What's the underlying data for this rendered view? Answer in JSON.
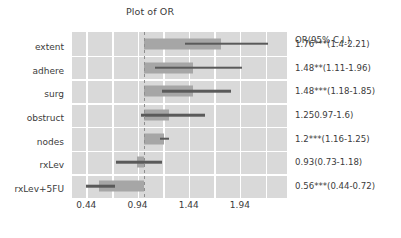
{
  "chart_data": {
    "type": "bar",
    "subtype": "forest-plot",
    "title": "Plot of OR",
    "xlabel": "",
    "ylabel": "",
    "xticks": [
      0.44,
      0.94,
      1.44,
      1.94
    ],
    "xtick_labels": [
      "0.44",
      "0.94",
      "1.44",
      "1.94"
    ],
    "xlim": [
      0.3,
      2.4
    ],
    "reference_line": 1.0,
    "grid": true,
    "grid_color": "#ffffff",
    "panel_color": "#d9d9d9",
    "bar_color": "#a6a6a6",
    "whisker_color": "#5a5a5a",
    "annotation_header": "OR(95% C.I.)",
    "categories": [
      "extent",
      "adhere",
      "surg",
      "obstruct",
      "nodes",
      "rxLev",
      "rxLev+5FU"
    ],
    "values": [
      1.76,
      1.48,
      1.48,
      1.25,
      1.2,
      0.93,
      0.56
    ],
    "ci_low": [
      1.4,
      1.11,
      1.18,
      0.97,
      1.16,
      0.73,
      0.44
    ],
    "ci_high": [
      2.21,
      1.96,
      1.85,
      1.6,
      1.25,
      1.18,
      0.72
    ],
    "significance": [
      "***",
      "**",
      "***",
      "",
      "***",
      "",
      "***"
    ],
    "rows": [
      {
        "label": "extent",
        "or": 1.76,
        "low": 1.4,
        "high": 2.21,
        "stars": "***",
        "annotation": "1.76***(1.4-2.21)"
      },
      {
        "label": "adhere",
        "or": 1.48,
        "low": 1.11,
        "high": 1.96,
        "stars": "**",
        "annotation": "1.48**(1.11-1.96)"
      },
      {
        "label": "surg",
        "or": 1.48,
        "low": 1.18,
        "high": 1.85,
        "stars": "***",
        "annotation": "1.48***(1.18-1.85)"
      },
      {
        "label": "obstruct",
        "or": 1.25,
        "low": 0.97,
        "high": 1.6,
        "stars": "",
        "annotation": "1.250.97-1.6)"
      },
      {
        "label": "nodes",
        "or": 1.2,
        "low": 1.16,
        "high": 1.25,
        "stars": "***",
        "annotation": "1.2***(1.16-1.25)"
      },
      {
        "label": "rxLev",
        "or": 0.93,
        "low": 0.73,
        "high": 1.18,
        "stars": "",
        "annotation": "0.93(0.73-1.18)"
      },
      {
        "label": "rxLev+5FU",
        "or": 0.56,
        "low": 0.44,
        "high": 0.72,
        "stars": "***",
        "annotation": "0.56***(0.44-0.72)"
      }
    ]
  }
}
